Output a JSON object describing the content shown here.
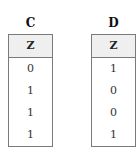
{
  "tables": [
    {
      "title": "C",
      "header": "Z",
      "values": [
        "0",
        "1",
        "1",
        "1"
      ]
    },
    {
      "title": "D",
      "header": "Z",
      "values": [
        "1",
        "0",
        "0",
        "1"
      ]
    }
  ],
  "colors": {
    "border": "#7a7a7a",
    "header_background": "#efefef",
    "text": "#222222"
  }
}
